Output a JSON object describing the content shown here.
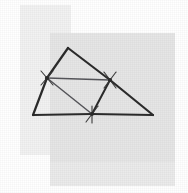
{
  "figure": {
    "canvas": {
      "width": 188,
      "height": 193,
      "background": "#ffffff"
    },
    "palette": {
      "background": "#ffffff",
      "rect_light": "#f2f2f2",
      "rect_mid": "#e6e6e6",
      "rect_lower": "#ebebeb",
      "line_dark": "#2b2b2b",
      "line_thin": "#55555a"
    },
    "rectangles": [
      {
        "name": "upper-left-rectangle",
        "x": 20,
        "y": 5,
        "width": 51,
        "height": 150,
        "fill": "#f2f2f2"
      },
      {
        "name": "main-gray-rectangle",
        "x": 50,
        "y": 33,
        "width": 125,
        "height": 129,
        "fill": "#e6e6e6"
      },
      {
        "name": "lower-gray-rectangle",
        "x": 50,
        "y": 162,
        "width": 125,
        "height": 24,
        "fill": "#ebebeb"
      }
    ],
    "points": {
      "apex": {
        "label": "A",
        "x": 68,
        "y": 48
      },
      "bottom_left": {
        "label": "B",
        "x": 33,
        "y": 115
      },
      "bottom_right": {
        "label": "C",
        "x": 153,
        "y": 115
      },
      "mid_left": {
        "label": "M_AB",
        "x": 47,
        "y": 78
      },
      "mid_right": {
        "label": "M_AC",
        "x": 110,
        "y": 80
      },
      "mid_bottom": {
        "label": "M_BC",
        "x": 92,
        "y": 114
      }
    },
    "segments": [
      {
        "name": "side-apex-to-mid-left",
        "from": "apex",
        "to": "mid_left",
        "weight": 2.2,
        "color": "#2b2b2b"
      },
      {
        "name": "side-apex-to-mid-right",
        "from": "apex",
        "to": "mid_right",
        "weight": 2.2,
        "color": "#2b2b2b"
      },
      {
        "name": "side-mid-left-to-bottom-left",
        "from": "mid_left",
        "to": "bottom_left",
        "weight": 2.2,
        "color": "#2b2b2b"
      },
      {
        "name": "side-mid-right-to-bottom-right",
        "from": "mid_right",
        "to": "bottom_right",
        "weight": 2.2,
        "color": "#2b2b2b"
      },
      {
        "name": "base-bottom-left-to-mid-bottom",
        "from": "bottom_left",
        "to": "mid_bottom",
        "weight": 2.2,
        "color": "#2b2b2b"
      },
      {
        "name": "base-mid-bottom-to-bottom-right",
        "from": "mid_bottom",
        "to": "bottom_right",
        "weight": 2.2,
        "color": "#2b2b2b"
      },
      {
        "name": "midline-left-to-right",
        "from": "mid_left",
        "to": "mid_right",
        "weight": 1.5,
        "color": "#55555a"
      },
      {
        "name": "midline-left-to-bottom",
        "from": "mid_left",
        "to": "mid_bottom",
        "weight": 1.5,
        "color": "#55555a"
      },
      {
        "name": "midline-right-to-bottom",
        "from": "mid_right",
        "to": "mid_bottom",
        "weight": 2.0,
        "color": "#2b2b2b"
      }
    ],
    "tick_marks": [
      {
        "name": "tick-mid-left-upper",
        "x1": 41,
        "y1": 71,
        "x2": 53,
        "y2": 85
      },
      {
        "name": "tick-mid-left-lower",
        "x1": 41,
        "y1": 85,
        "x2": 53,
        "y2": 71
      },
      {
        "name": "tick-mid-right-upper",
        "x1": 104,
        "y1": 72,
        "x2": 116,
        "y2": 88
      },
      {
        "name": "tick-mid-right-lower",
        "x1": 104,
        "y1": 88,
        "x2": 116,
        "y2": 72
      },
      {
        "name": "tick-mid-bottom-vertical",
        "x1": 92,
        "y1": 106,
        "x2": 92,
        "y2": 123
      },
      {
        "name": "tick-mid-bottom-cross",
        "x1": 86,
        "y1": 122,
        "x2": 98,
        "y2": 106
      }
    ]
  }
}
